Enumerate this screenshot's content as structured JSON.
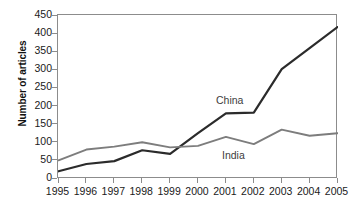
{
  "chart_data": {
    "type": "line",
    "title": "",
    "xlabel": "",
    "ylabel": "Number of articles",
    "categories": [
      "1995",
      "1996",
      "1997",
      "1998",
      "1999",
      "2000",
      "2001",
      "2002",
      "2003",
      "2004",
      "2005"
    ],
    "x": [
      1995,
      1996,
      1997,
      1998,
      1999,
      2000,
      2001,
      2002,
      2003,
      2004,
      2005
    ],
    "ylim": [
      0,
      450
    ],
    "xlim": [
      1995,
      2005
    ],
    "yticks": [
      0,
      50,
      100,
      150,
      200,
      250,
      300,
      350,
      400,
      450
    ],
    "ytick_labels": [
      "0",
      "50",
      "100",
      "150",
      "200",
      "250",
      "300",
      "350",
      "400",
      "450"
    ],
    "grid": false,
    "legend_position": "inline-annotations",
    "series": [
      {
        "name": "China",
        "color": "#2b2b2b",
        "values": [
          20,
          40,
          48,
          78,
          68,
          125,
          180,
          182,
          302,
          360,
          418
        ],
        "annotation": "China"
      },
      {
        "name": "India",
        "color": "#7d7d7d",
        "values": [
          50,
          80,
          88,
          100,
          86,
          90,
          115,
          95,
          135,
          118,
          125
        ],
        "annotation": "India"
      }
    ],
    "annotations": [
      {
        "text": "China",
        "series": "China"
      },
      {
        "text": "India",
        "series": "India"
      }
    ],
    "axis_color": "#8c8c8c",
    "background": "#ffffff"
  }
}
